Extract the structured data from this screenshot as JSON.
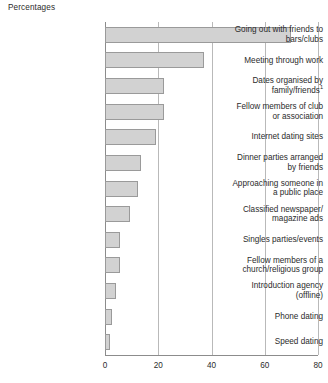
{
  "chart_data": {
    "type": "bar",
    "orientation": "horizontal",
    "title": "Percentages",
    "xlabel": "",
    "ylabel": "",
    "xlim": [
      0,
      80
    ],
    "xticks": [
      0,
      20,
      40,
      60,
      80
    ],
    "xtick_labels": [
      "0",
      "20",
      "40",
      "60",
      "80"
    ],
    "grid": true,
    "grid_axis": "x",
    "legend": false,
    "categories": [
      "Going out with friends to bars/clubs",
      "Meeting through work",
      "Dates organised by family/friends",
      "Fellow members of club or association",
      "Internet dating sites",
      "Dinner parties arranged by friends",
      "Approaching someone in a public place",
      "Classified newspaper/ magazine ads",
      "Singles parties/events",
      "Fellow members of a church/religious group",
      "Introduction agency (offline)",
      "Phone dating",
      "Speed dating"
    ],
    "values": [
      70,
      37,
      22,
      22,
      19,
      13.5,
      12.5,
      9.5,
      5.5,
      5.5,
      4,
      2.5,
      2
    ],
    "bar_color": "#d2d2d2",
    "bar_border_color": "#9a9a9a",
    "axis_color": "#8c8c8c",
    "grid_color": "#b9b9b9",
    "background": "#ffffff"
  },
  "labels": {
    "l0": [
      "Going out with friends to",
      "bars/clubs"
    ],
    "l1": [
      "Meeting through work"
    ],
    "l2": [
      "Dates organised by",
      "family/friends"
    ],
    "l2_sup": "1",
    "l3": [
      "Fellow members of club",
      "or association"
    ],
    "l4": [
      "Internet dating sites"
    ],
    "l5": [
      "Dinner parties arranged",
      "by friends"
    ],
    "l6": [
      "Approaching someone in",
      "a public place"
    ],
    "l7": [
      "Classified newspaper/",
      "magazine ads"
    ],
    "l8": [
      "Singles parties/events"
    ],
    "l9": [
      "Fellow members of a",
      "church/religious group"
    ],
    "l10": [
      "Introduction agency",
      "(offline)"
    ],
    "l11": [
      "Phone dating"
    ],
    "l12": [
      "Speed dating"
    ]
  }
}
